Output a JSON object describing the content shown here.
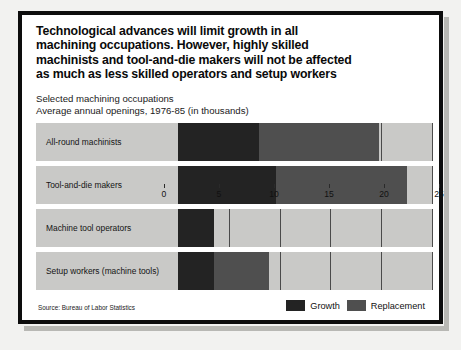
{
  "headline": {
    "lines": [
      "Technological advances will limit growth in all",
      "machining occupations. However, highly skilled",
      "machinists and tool-and-die makers will not be affected",
      "as much as less skilled operators and setup workers"
    ]
  },
  "subtitle": {
    "lines": [
      "Selected machining occupations",
      "Average annual openings, 1976-85 (in thousands)"
    ]
  },
  "source": "Source: Bureau of Labor Statistics",
  "legend": {
    "items": [
      {
        "label": "Growth",
        "color": "#232323",
        "name": "growth"
      },
      {
        "label": "Replacement",
        "color": "#4f4f4f",
        "name": "replacement"
      }
    ]
  },
  "colors": {
    "growth": "#232323",
    "replacement": "#4f4f4f",
    "track": "#c9c9c7",
    "frame": "#0d0d0d",
    "page": "#f2f2f0",
    "gridline": "#4a4a4a"
  },
  "chart_data": {
    "type": "bar",
    "orientation": "horizontal",
    "stacked": true,
    "subtitle": "Selected machining occupations. Average annual openings, 1976-85 (in thousands)",
    "xlabel": "",
    "ylabel": "",
    "xlim": [
      0,
      25
    ],
    "xticks": [
      0,
      5,
      10,
      15,
      20,
      25
    ],
    "xticklabels": [
      "0",
      "5",
      "10",
      "15",
      "20",
      "25"
    ],
    "grid": true,
    "legend_position": "bottom-right",
    "categories": [
      "All-round machinists",
      "Tool-and-die makers",
      "Machine tool operators",
      "Setup workers (machine tools)"
    ],
    "series": [
      {
        "name": "Growth",
        "color": "#232323",
        "values": [
          8.0,
          9.6,
          3.5,
          3.5
        ]
      },
      {
        "name": "Replacement",
        "color": "#4f4f4f",
        "values": [
          11.8,
          12.9,
          0.0,
          5.5
        ]
      }
    ],
    "totals": [
      19.8,
      22.5,
      3.5,
      9.0
    ],
    "units": "thousands of average annual openings"
  }
}
